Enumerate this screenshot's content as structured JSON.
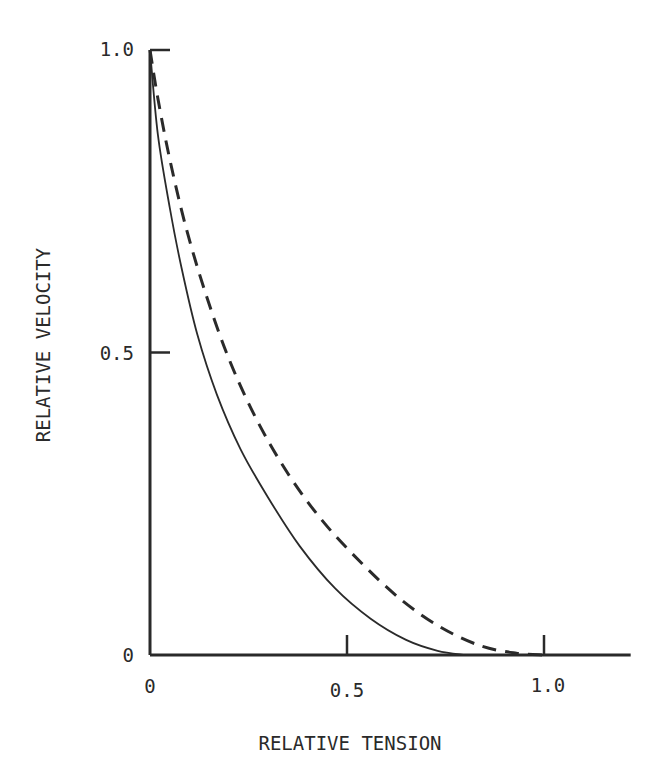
{
  "chart_data": {
    "type": "line",
    "title": "",
    "xlabel": "RELATIVE TENSION",
    "ylabel": "RELATIVE VELOCITY",
    "xlim": [
      0,
      1.22
    ],
    "ylim": [
      0,
      1.0
    ],
    "x_ticks": [
      0,
      0.5,
      1.0
    ],
    "x_tick_labels": [
      "0",
      "0.5",
      "1.0"
    ],
    "y_ticks": [
      0,
      0.5,
      1.0
    ],
    "y_tick_labels": [
      "0",
      "0.5",
      "1.0"
    ],
    "grid": false,
    "legend": "none",
    "series": [
      {
        "name": "solid",
        "style": "solid",
        "x": [
          0.0,
          0.02,
          0.05,
          0.08,
          0.12,
          0.17,
          0.23,
          0.3,
          0.38,
          0.47,
          0.56,
          0.65,
          0.73,
          0.8
        ],
        "y": [
          1.0,
          0.86,
          0.74,
          0.64,
          0.53,
          0.43,
          0.34,
          0.26,
          0.18,
          0.11,
          0.06,
          0.025,
          0.007,
          0.0
        ]
      },
      {
        "name": "dashed",
        "style": "dashed",
        "x": [
          0.0,
          0.02,
          0.05,
          0.09,
          0.14,
          0.2,
          0.27,
          0.35,
          0.44,
          0.54,
          0.64,
          0.74,
          0.84,
          0.93,
          1.0
        ],
        "y": [
          1.0,
          0.92,
          0.82,
          0.71,
          0.6,
          0.49,
          0.39,
          0.3,
          0.22,
          0.15,
          0.09,
          0.045,
          0.015,
          0.003,
          0.0
        ]
      }
    ]
  }
}
